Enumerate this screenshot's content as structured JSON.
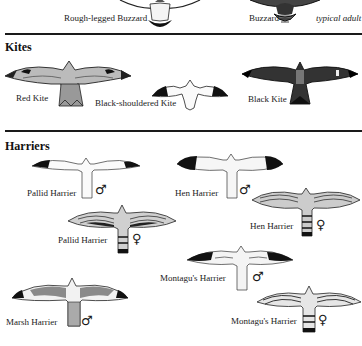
{
  "buzzards": {
    "rough_legged": "Rough-legged Buzzard",
    "buzzard": "Buzzard",
    "buzzard_note": "typical adult"
  },
  "kites": {
    "heading": "Kites",
    "red": "Red Kite",
    "black_shouldered": "Black-shouldered Kite",
    "black": "Black Kite"
  },
  "harriers": {
    "heading": "Harriers",
    "items": [
      {
        "name": "Pallid Harrier",
        "sex": "♂"
      },
      {
        "name": "Hen Harrier",
        "sex": "♂"
      },
      {
        "name": "Pallid Harrier",
        "sex": "♀"
      },
      {
        "name": "Hen Harrier",
        "sex": "♀"
      },
      {
        "name": "Montagu's Harrier",
        "sex": "♂"
      },
      {
        "name": "Marsh Harrier",
        "sex": "♂"
      },
      {
        "name": "Montagu's Harrier",
        "sex": "♀"
      }
    ]
  },
  "colors": {
    "ink": "#1a1a1a",
    "paper": "#ffffff"
  }
}
